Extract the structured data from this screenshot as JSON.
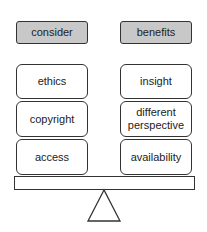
{
  "left": {
    "header": "consider",
    "items": [
      "ethics",
      "copyright",
      "access"
    ]
  },
  "right": {
    "header": "benefits",
    "items": [
      "insight",
      "different perspective",
      "availability"
    ]
  },
  "colors": {
    "header_fill": "#c8c8c8",
    "stroke": "#333333"
  }
}
